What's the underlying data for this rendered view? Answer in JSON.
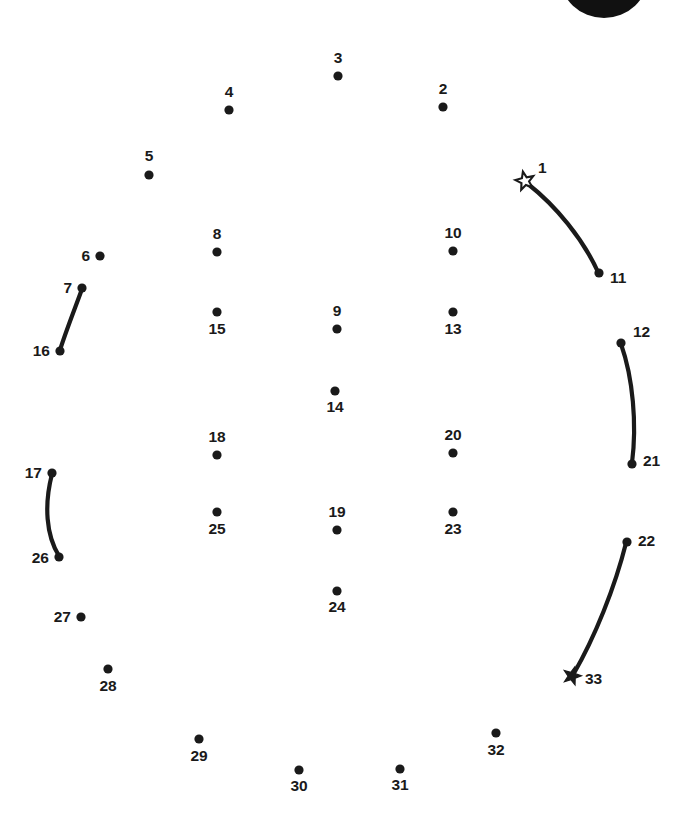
{
  "page": {
    "width": 686,
    "height": 819,
    "background_color": "#ffffff",
    "ink_color": "#1a1a1a",
    "total_dots": 33,
    "start_marker": "hollow-star",
    "end_marker": "filled-star"
  },
  "artwork": {
    "top_shape_label": "partial black shape cropped at top edge",
    "top_shape_color": "#111111"
  },
  "dots": [
    {
      "n": "1",
      "x": 525,
      "y": 181,
      "marker": "star-hollow",
      "label_x": 538,
      "label_y": 173,
      "anchor": "start"
    },
    {
      "n": "2",
      "x": 443,
      "y": 107,
      "marker": "dot",
      "label_x": 443,
      "label_y": 94,
      "anchor": "middle"
    },
    {
      "n": "3",
      "x": 338,
      "y": 76,
      "marker": "dot",
      "label_x": 338,
      "label_y": 63,
      "anchor": "middle"
    },
    {
      "n": "4",
      "x": 229,
      "y": 110,
      "marker": "dot",
      "label_x": 229,
      "label_y": 97,
      "anchor": "middle"
    },
    {
      "n": "5",
      "x": 149,
      "y": 175,
      "marker": "dot",
      "label_x": 149,
      "label_y": 161,
      "anchor": "middle"
    },
    {
      "n": "6",
      "x": 100,
      "y": 256,
      "marker": "dot",
      "label_x": 90,
      "label_y": 261,
      "anchor": "end"
    },
    {
      "n": "7",
      "x": 82,
      "y": 288,
      "marker": "dot",
      "label_x": 72,
      "label_y": 293,
      "anchor": "end"
    },
    {
      "n": "8",
      "x": 217,
      "y": 252,
      "marker": "dot",
      "label_x": 217,
      "label_y": 239,
      "anchor": "middle"
    },
    {
      "n": "9",
      "x": 337,
      "y": 329,
      "marker": "dot",
      "label_x": 337,
      "label_y": 316,
      "anchor": "middle"
    },
    {
      "n": "10",
      "x": 453,
      "y": 251,
      "marker": "dot",
      "label_x": 453,
      "label_y": 238,
      "anchor": "middle"
    },
    {
      "n": "11",
      "x": 599,
      "y": 273,
      "marker": "dot",
      "label_x": 610,
      "label_y": 283,
      "anchor": "start"
    },
    {
      "n": "12",
      "x": 621,
      "y": 343,
      "marker": "dot",
      "label_x": 633,
      "label_y": 337,
      "anchor": "start"
    },
    {
      "n": "13",
      "x": 453,
      "y": 312,
      "marker": "dot",
      "label_x": 453,
      "label_y": 334,
      "anchor": "middle"
    },
    {
      "n": "14",
      "x": 335,
      "y": 391,
      "marker": "dot",
      "label_x": 335,
      "label_y": 412,
      "anchor": "middle"
    },
    {
      "n": "15",
      "x": 217,
      "y": 312,
      "marker": "dot",
      "label_x": 217,
      "label_y": 334,
      "anchor": "middle"
    },
    {
      "n": "16",
      "x": 60,
      "y": 351,
      "marker": "dot",
      "label_x": 50,
      "label_y": 356,
      "anchor": "end"
    },
    {
      "n": "17",
      "x": 52,
      "y": 473,
      "marker": "dot",
      "label_x": 42,
      "label_y": 478,
      "anchor": "end"
    },
    {
      "n": "18",
      "x": 217,
      "y": 455,
      "marker": "dot",
      "label_x": 217,
      "label_y": 442,
      "anchor": "middle"
    },
    {
      "n": "19",
      "x": 337,
      "y": 530,
      "marker": "dot",
      "label_x": 337,
      "label_y": 517,
      "anchor": "middle"
    },
    {
      "n": "20",
      "x": 453,
      "y": 453,
      "marker": "dot",
      "label_x": 453,
      "label_y": 440,
      "anchor": "middle"
    },
    {
      "n": "21",
      "x": 632,
      "y": 464,
      "marker": "dot",
      "label_x": 643,
      "label_y": 466,
      "anchor": "start"
    },
    {
      "n": "22",
      "x": 627,
      "y": 542,
      "marker": "dot",
      "label_x": 638,
      "label_y": 546,
      "anchor": "start"
    },
    {
      "n": "23",
      "x": 453,
      "y": 512,
      "marker": "dot",
      "label_x": 453,
      "label_y": 534,
      "anchor": "middle"
    },
    {
      "n": "24",
      "x": 337,
      "y": 591,
      "marker": "dot",
      "label_x": 337,
      "label_y": 612,
      "anchor": "middle"
    },
    {
      "n": "25",
      "x": 217,
      "y": 512,
      "marker": "dot",
      "label_x": 217,
      "label_y": 534,
      "anchor": "middle"
    },
    {
      "n": "26",
      "x": 59,
      "y": 557,
      "marker": "dot",
      "label_x": 49,
      "label_y": 563,
      "anchor": "end"
    },
    {
      "n": "27",
      "x": 81,
      "y": 617,
      "marker": "dot",
      "label_x": 71,
      "label_y": 622,
      "anchor": "end"
    },
    {
      "n": "28",
      "x": 108,
      "y": 669,
      "marker": "dot",
      "label_x": 108,
      "label_y": 691,
      "anchor": "middle"
    },
    {
      "n": "29",
      "x": 199,
      "y": 739,
      "marker": "dot",
      "label_x": 199,
      "label_y": 761,
      "anchor": "middle"
    },
    {
      "n": "30",
      "x": 299,
      "y": 770,
      "marker": "dot",
      "label_x": 299,
      "label_y": 791,
      "anchor": "middle"
    },
    {
      "n": "31",
      "x": 400,
      "y": 769,
      "marker": "dot",
      "label_x": 400,
      "label_y": 790,
      "anchor": "middle"
    },
    {
      "n": "32",
      "x": 496,
      "y": 733,
      "marker": "dot",
      "label_x": 496,
      "label_y": 755,
      "anchor": "middle"
    },
    {
      "n": "33",
      "x": 572,
      "y": 676,
      "marker": "star-filled",
      "label_x": 585,
      "label_y": 684,
      "anchor": "start"
    }
  ],
  "curves": [
    {
      "from": "1",
      "to": "11",
      "path": "M 528 184 C 556 206 583 239 598 272"
    },
    {
      "from": "7",
      "to": "16",
      "path": "M 82 289 C 74 311 66 331 60 350"
    },
    {
      "from": "12",
      "to": "21",
      "path": "M 621 344 C 633 378 637 424 632 463"
    },
    {
      "from": "17",
      "to": "26",
      "path": "M 52 474 C 44 505 46 535 59 556"
    },
    {
      "from": "22",
      "to": "33",
      "path": "M 626 543 C 615 587 595 637 573 675"
    }
  ]
}
